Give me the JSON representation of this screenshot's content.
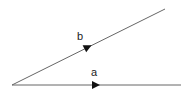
{
  "diagram": {
    "type": "vector-angle",
    "origin": {
      "x": 12,
      "y": 85
    },
    "vectors": [
      {
        "name": "a",
        "label": "a",
        "end": {
          "x": 181,
          "y": 85
        },
        "arrow": {
          "x": 97,
          "y": 85
        },
        "label_pos": {
          "x": 93,
          "y": 75
        }
      },
      {
        "name": "b",
        "label": "b",
        "end": {
          "x": 165,
          "y": 9
        },
        "arrow": {
          "x": 88,
          "y": 47
        },
        "label_pos": {
          "x": 79,
          "y": 40
        }
      }
    ],
    "colors": {
      "line": "#555555",
      "arrow": "#111111",
      "background": "#ffffff"
    }
  }
}
